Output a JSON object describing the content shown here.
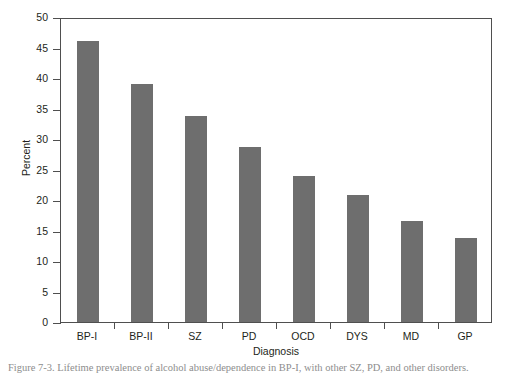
{
  "chart_data": {
    "type": "bar",
    "title": "",
    "xlabel": "Diagnosis",
    "ylabel": "Percent",
    "categories": [
      "BP-I",
      "BP-II",
      "SZ",
      "PD",
      "OCD",
      "DYS",
      "MD",
      "GP"
    ],
    "values": [
      46.3,
      39.3,
      34.0,
      28.9,
      24.1,
      21.0,
      16.6,
      13.8
    ],
    "ylim": [
      0,
      50
    ],
    "ytick_labels": [
      "0",
      "5",
      "10",
      "15",
      "20",
      "25",
      "30",
      "35",
      "40",
      "45",
      "50"
    ],
    "ytick_values": [
      0,
      5,
      10,
      15,
      20,
      25,
      30,
      35,
      40,
      45,
      50
    ],
    "grid": false,
    "legend": false,
    "bar_color": "#6e6e6e",
    "axis_color": "#4f4f4f",
    "background": "#ffffff"
  },
  "caption": {
    "text": "Figure 7-3.  Lifetime prevalence of alcohol abuse/dependence in BP-I, with other SZ, PD, and other disorders."
  }
}
